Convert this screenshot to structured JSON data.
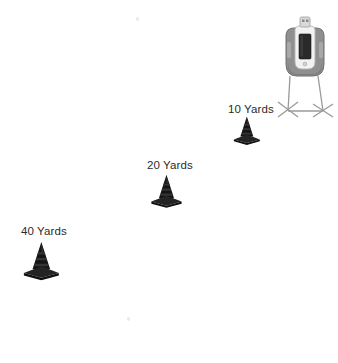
{
  "scene": {
    "title": "Sprint Drill Cone Layout",
    "background_color": "#ffffff",
    "width": 338,
    "height": 363
  },
  "markers": [
    {
      "id": "cone-10",
      "label": "10 Yards",
      "distance_value": 10,
      "distance_unit": "Yards",
      "label_x": 228,
      "label_y": 104,
      "cone_x": 231,
      "cone_y": 115,
      "cone_scale": 0.72,
      "cone_color": "#141414"
    },
    {
      "id": "cone-20",
      "label": "20 Yards",
      "distance_value": 20,
      "distance_unit": "Yards",
      "label_x": 147,
      "label_y": 160,
      "cone_x": 148,
      "cone_y": 173,
      "cone_scale": 0.84,
      "cone_color": "#141414"
    },
    {
      "id": "cone-40",
      "label": "40 Yards",
      "distance_value": 40,
      "distance_unit": "Yards",
      "label_x": 21,
      "label_y": 226,
      "cone_x": 20,
      "cone_y": 240,
      "cone_scale": 0.97,
      "cone_color": "#141414"
    }
  ],
  "device": {
    "name": "timing-device",
    "x": 272,
    "y": 14,
    "housing_color": "#8f8f8f",
    "housing_shadow_color": "#6e6e6e",
    "panel_color": "#f2f2f2",
    "screen_color": "#2a2a2a",
    "connector_color": "#d9d9d9",
    "tripod_color": "#9a9a9a"
  },
  "specks": [
    {
      "x": 136,
      "y": 17
    },
    {
      "x": 127,
      "y": 317
    }
  ],
  "colors": {
    "text": "#2b2b2b",
    "cone_dark": "#141414",
    "cone_mid": "#242424",
    "cone_light": "#3a3a3a",
    "background": "#ffffff"
  }
}
